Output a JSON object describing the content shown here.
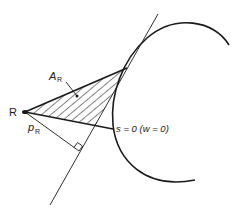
{
  "diagram": {
    "type": "geometric-construction",
    "colors": {
      "stroke": "#1a1a1a",
      "background": "#ffffff"
    },
    "labels": {
      "point_r": "R",
      "area": {
        "main": "A",
        "sub": "R"
      },
      "perpendicular": {
        "main": "p",
        "sub": "R"
      },
      "curve": "s = 0 (w = 0)"
    },
    "elements": {
      "point_r": {
        "x": 25,
        "y": 112
      },
      "tangent_point": {
        "x": 127,
        "y": 68
      },
      "chord_end": {
        "x": 113,
        "y": 129
      },
      "tangent_line": {
        "x1": 50,
        "y1": 205,
        "x2": 158,
        "y2": 14
      },
      "foot_of_perpendicular": {
        "x": 79,
        "y": 151
      }
    }
  }
}
